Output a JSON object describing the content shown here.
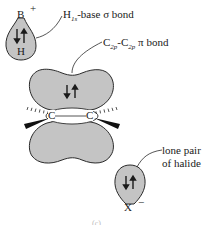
{
  "diagram": {
    "type": "orbital-illustration",
    "atoms": {
      "boron": "B",
      "boron_charge": "+",
      "hydrogen": "H",
      "carbon_left": "C",
      "carbon_right": "C",
      "halide": "X",
      "halide_charge": "−"
    },
    "labels": {
      "sigma_bond": {
        "main": "H",
        "sub": "1s",
        "rest": "-base σ bond"
      },
      "pi_bond": {
        "c1": "C",
        "sub1": "2p",
        "dash": "-",
        "c2": "C",
        "sub2": "2p",
        "rest": " π bond"
      },
      "lone_pair_line1": "lone pair",
      "lone_pair_line2": "of halide"
    },
    "caption": "(c)",
    "colors": {
      "orbital_fill": "#c4c4c4",
      "outline": "#2a2a2a",
      "background": "#ffffff"
    }
  }
}
